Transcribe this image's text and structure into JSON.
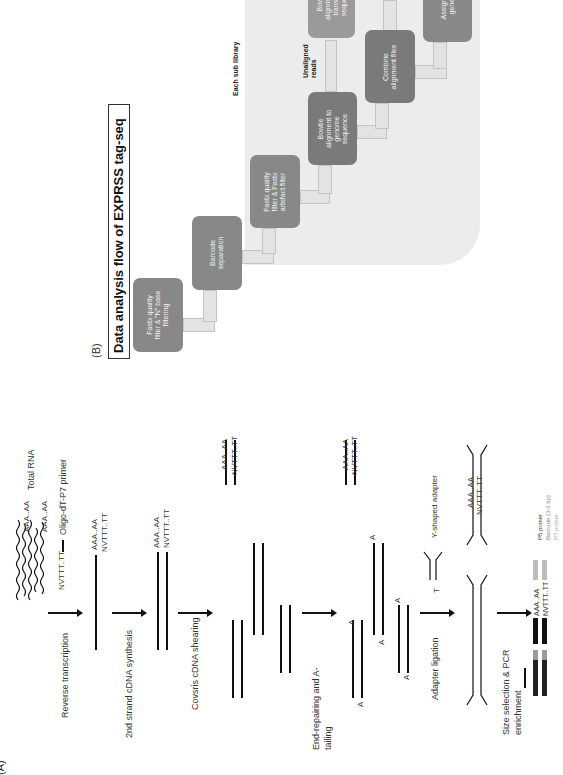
{
  "panel_b": {
    "label": "(B)",
    "title": "Data analysis flow of EXPRSS tag-seq",
    "group_label": "Each sub library",
    "unaligned_label": "Unaligned reads",
    "steps": [
      {
        "id": "fastx-n",
        "label": "Fastx quality\nfilter & \"N\" base\nfiltering"
      },
      {
        "id": "barcode",
        "label": "Barcode\nseparation"
      },
      {
        "id": "fastx-artefact",
        "label": "Fastx quality\nfilter & Fastx\nartefact filter"
      },
      {
        "id": "bowtie-genome",
        "label": "Bowtie\nalignment to\ngenome\nsequence"
      },
      {
        "id": "combine",
        "label": "Combine\nalignment files"
      },
      {
        "id": "bowtie-transcript",
        "label": "Bowtie\nalignment to\ntranscript\nsequence"
      },
      {
        "id": "assign",
        "label": "Assign to\ngenes"
      }
    ],
    "colors": {
      "panel_bg": "#ececec",
      "box_dark": "#7a7a7a",
      "box_mid": "#888888",
      "arrow_fill": "#e3e3e3"
    }
  },
  "panel_a": {
    "label": "(A)",
    "total_rna": "Total RNA",
    "polya_1": "AAA..AA",
    "polya_2": "AAA..AA",
    "primer_seq": "NVTTT..TT",
    "primer_label": "Oligo-dT-P7 primer",
    "steps": [
      {
        "label": "Reverse transcription"
      },
      {
        "label": "2nd strand cDNA synthesis"
      },
      {
        "label": "Covsris cDNA shearing"
      },
      {
        "label": "End-repairing and A-\ntailing"
      },
      {
        "label": "Adapter ligation"
      },
      {
        "label": "Size selection & PCR\nenrichment"
      }
    ],
    "rt_top": "AAA..AA",
    "rt_bottom": "NVTTT..TT",
    "ds_top": "AAA..AA",
    "ds_bottom": "NVTTT..TT",
    "shear_top": "AAA..AA",
    "shear_bottom": "NVTTT..TT",
    "er_top": "AAA..AA",
    "er_bottom": "NVTTT..TT",
    "a_base": "A",
    "t_base": "T",
    "y_adapter_label": "Y-shaped adapter",
    "lig_top": "AAA..AA",
    "lig_bottom": "NVTTT..TT",
    "final_top": "AAA..AA",
    "final_bottom": "NVTTT..TT",
    "legend": [
      {
        "label": "P5 primer",
        "color": "#333333"
      },
      {
        "label": "Barcode (3-6 bp)",
        "color": "#9a9a9a"
      },
      {
        "label": "P7 primer",
        "color": "#bdbdbd"
      }
    ]
  }
}
